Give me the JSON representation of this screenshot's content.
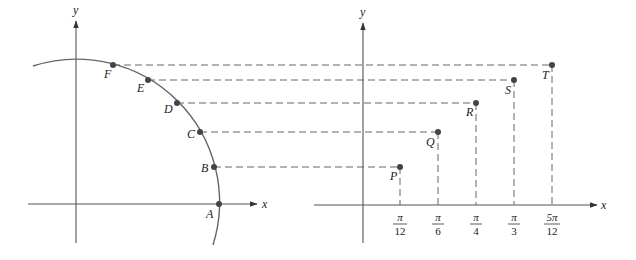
{
  "figure": {
    "left_panel": {
      "axes": {
        "x_label": "x",
        "y_label": "y"
      },
      "points": [
        {
          "name": "A",
          "angle_deg": 0
        },
        {
          "name": "B",
          "angle_deg": 15
        },
        {
          "name": "C",
          "angle_deg": 30
        },
        {
          "name": "D",
          "angle_deg": 45
        },
        {
          "name": "E",
          "angle_deg": 60
        },
        {
          "name": "F",
          "angle_deg": 75
        }
      ]
    },
    "right_panel": {
      "axes": {
        "x_label": "x",
        "y_label": "y"
      },
      "points": [
        {
          "name": "P",
          "tick_num": "π",
          "tick_den": "12"
        },
        {
          "name": "Q",
          "tick_num": "π",
          "tick_den": "6"
        },
        {
          "name": "R",
          "tick_num": "π",
          "tick_den": "4"
        },
        {
          "name": "S",
          "tick_num": "π",
          "tick_den": "3"
        },
        {
          "name": "T",
          "tick_num": "5π",
          "tick_den": "12"
        }
      ]
    }
  }
}
